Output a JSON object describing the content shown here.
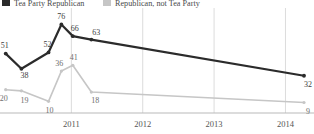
{
  "legend": {
    "position": "top-left",
    "entries": [
      {
        "label": "Tea Party Republican",
        "color": "#2b2b2b",
        "swatch": "dark"
      },
      {
        "label": "Republican, not Tea Party",
        "color": "#c6c6c6",
        "swatch": "light"
      }
    ]
  },
  "axis": {
    "x_ticks": [
      "2011",
      "2012",
      "2013",
      "2014"
    ],
    "baseline_color": "#b9b9b9",
    "gridline_color": "#dcdcdc"
  },
  "chart_data": {
    "type": "line",
    "title": "",
    "subtitle": "",
    "xlabel": "",
    "ylabel": "",
    "grid": true,
    "legend_position": "top-left",
    "xlim": [
      2010.0,
      2014.4
    ],
    "ylim": [
      0,
      85
    ],
    "x_tick_labels": [
      "2011",
      "2012",
      "2013",
      "2014"
    ],
    "x_tick_values": [
      2011,
      2012,
      2013,
      2014
    ],
    "series": [
      {
        "name": "Tea Party Republican",
        "color": "#2b2b2b",
        "x": [
          2010.08,
          2010.3,
          2010.68,
          2010.86,
          2011.02,
          2011.28,
          2014.26
        ],
        "values": [
          51,
          38,
          52,
          76,
          66,
          63,
          32
        ],
        "labels": [
          "51",
          "38",
          "52",
          "76",
          "66",
          "63",
          "32"
        ]
      },
      {
        "name": "Republican, not Tea Party",
        "color": "#c6c6c6",
        "x": [
          2010.08,
          2010.3,
          2010.68,
          2010.86,
          2011.02,
          2011.28,
          2014.26
        ],
        "values": [
          20,
          19,
          10,
          36,
          41,
          18,
          9
        ],
        "labels": [
          "20",
          "19",
          "10",
          "36",
          "41",
          "18",
          "9"
        ]
      }
    ]
  }
}
